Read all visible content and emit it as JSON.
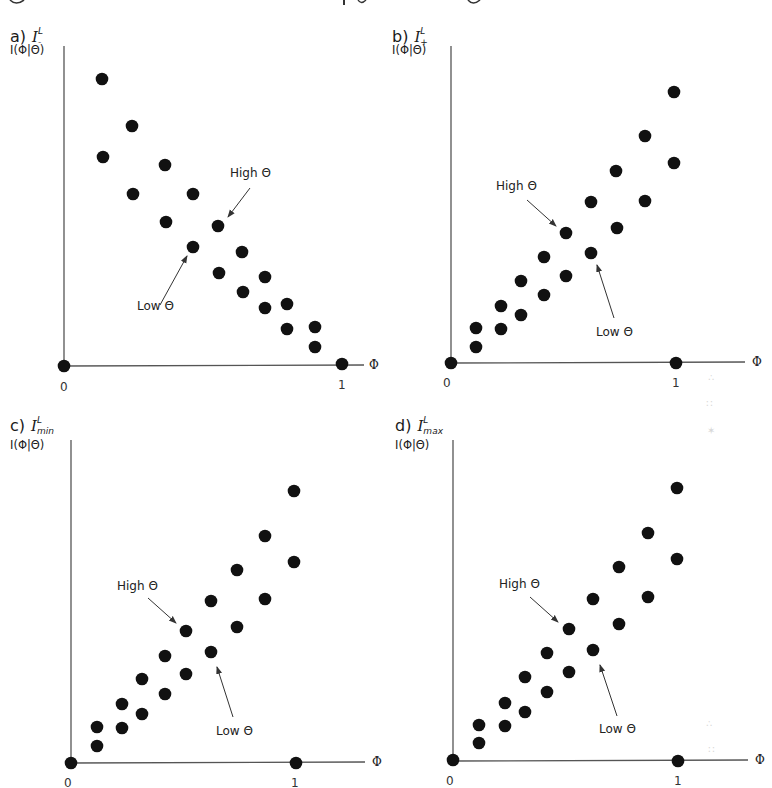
{
  "figure": {
    "caption_cropped": "g                                         , y    g",
    "axis_color": "#555555",
    "dot_color": "#111111",
    "arrow_color": "#333333",
    "dot_radius": 6.3
  },
  "panels": [
    {
      "id": "a",
      "letter": "a)",
      "symbol": "I",
      "superscript": "L",
      "subscript": "-",
      "ylabel": "I(Φ|Θ)",
      "xlabel": "Φ",
      "tick0": "0",
      "tick1": "1",
      "layout": {
        "label_pos": [
          10,
          27
        ],
        "ylabel_pos": [
          10,
          43
        ],
        "origin": [
          64,
          366
        ],
        "yaxis_top": 46,
        "xaxis_end": 364,
        "xlabel_pos": [
          369,
          358
        ],
        "tick0_pos": [
          60,
          380
        ],
        "tick1_pos": [
          338,
          378
        ]
      },
      "high_label": "High Θ",
      "low_label": "Low Θ",
      "high_label_pos": [
        230,
        166
      ],
      "low_label_pos": [
        137,
        299
      ],
      "high_arrow": [
        [
          250,
          188
        ],
        [
          228,
          217
        ]
      ],
      "low_arrow": [
        [
          160,
          305
        ],
        [
          187,
          256
        ]
      ],
      "points_px": [
        [
          64,
          366
        ],
        [
          342,
          364
        ],
        [
          102,
          79
        ],
        [
          103,
          157
        ],
        [
          132,
          126
        ],
        [
          133,
          194
        ],
        [
          165,
          165
        ],
        [
          166,
          222
        ],
        [
          193,
          194
        ],
        [
          193,
          247
        ],
        [
          218,
          226
        ],
        [
          219,
          273
        ],
        [
          242,
          252
        ],
        [
          243,
          292
        ],
        [
          265,
          277
        ],
        [
          265,
          308
        ],
        [
          287,
          304
        ],
        [
          287,
          329
        ],
        [
          315,
          327
        ],
        [
          315,
          347
        ]
      ]
    },
    {
      "id": "b",
      "letter": "b)",
      "symbol": "I",
      "superscript": "L",
      "subscript": "+",
      "ylabel": "I(Φ|Θ)",
      "xlabel": "Φ",
      "tick0": "0",
      "tick1": "1",
      "layout": {
        "label_pos": [
          392,
          27
        ],
        "ylabel_pos": [
          392,
          43
        ],
        "origin": [
          451,
          363
        ],
        "yaxis_top": 46,
        "xaxis_end": 745,
        "xlabel_pos": [
          752,
          355
        ],
        "tick0_pos": [
          443,
          376
        ],
        "tick1_pos": [
          672,
          376
        ]
      },
      "high_label": "High Θ",
      "low_label": "Low Θ",
      "high_label_pos": [
        496,
        179
      ],
      "low_label_pos": [
        596,
        325
      ],
      "high_arrow": [
        [
          527,
          200
        ],
        [
          556,
          226
        ]
      ],
      "low_arrow": [
        [
          614,
          318
        ],
        [
          597,
          265
        ]
      ],
      "points_px": [
        [
          451,
          363
        ],
        [
          676,
          363
        ],
        [
          476,
          328
        ],
        [
          476,
          347
        ],
        [
          501,
          306
        ],
        [
          501,
          329
        ],
        [
          521,
          281
        ],
        [
          521,
          315
        ],
        [
          544,
          257
        ],
        [
          544,
          295
        ],
        [
          566,
          233
        ],
        [
          566,
          276
        ],
        [
          591,
          202
        ],
        [
          591,
          253
        ],
        [
          616,
          171
        ],
        [
          617,
          228
        ],
        [
          645,
          136
        ],
        [
          645,
          201
        ],
        [
          674,
          92
        ],
        [
          674,
          163
        ]
      ]
    },
    {
      "id": "c",
      "letter": "c)",
      "symbol": "I",
      "superscript": "L",
      "subscript": "min",
      "ylabel": "I(Φ|Θ)",
      "xlabel": "Φ",
      "tick0": "0",
      "tick1": "1",
      "layout": {
        "label_pos": [
          10,
          416
        ],
        "ylabel_pos": [
          10,
          438
        ],
        "origin": [
          71,
          763
        ],
        "yaxis_top": 440,
        "xaxis_end": 365,
        "xlabel_pos": [
          372,
          755
        ],
        "tick0_pos": [
          64,
          776
        ],
        "tick1_pos": [
          291,
          776
        ]
      },
      "high_label": "High Θ",
      "low_label": "Low Θ",
      "high_label_pos": [
        117,
        579
      ],
      "low_label_pos": [
        216,
        724
      ],
      "high_arrow": [
        [
          148,
          598
        ],
        [
          176,
          623
        ]
      ],
      "low_arrow": [
        [
          233,
          717
        ],
        [
          217,
          667
        ]
      ],
      "points_px": [
        [
          71,
          763
        ],
        [
          296,
          763
        ],
        [
          97,
          727
        ],
        [
          97,
          746
        ],
        [
          122,
          704
        ],
        [
          122,
          728
        ],
        [
          142,
          679
        ],
        [
          142,
          714
        ],
        [
          165,
          656
        ],
        [
          165,
          694
        ],
        [
          186,
          631
        ],
        [
          186,
          674
        ],
        [
          211,
          601
        ],
        [
          211,
          652
        ],
        [
          237,
          570
        ],
        [
          237,
          627
        ],
        [
          265,
          536
        ],
        [
          265,
          599
        ],
        [
          294,
          491
        ],
        [
          294,
          562
        ]
      ]
    },
    {
      "id": "d",
      "letter": "d)",
      "symbol": "I",
      "superscript": "L",
      "subscript": "max",
      "ylabel": "I(Φ|Θ)",
      "xlabel": "Φ",
      "tick0": "0",
      "tick1": "1",
      "layout": {
        "label_pos": [
          395,
          416
        ],
        "ylabel_pos": [
          395,
          438
        ],
        "origin": [
          453,
          761
        ],
        "yaxis_top": 440,
        "xaxis_end": 748,
        "xlabel_pos": [
          755,
          753
        ],
        "tick0_pos": [
          446,
          774
        ],
        "tick1_pos": [
          674,
          774
        ]
      },
      "high_label": "High Θ",
      "low_label": "Low Θ",
      "high_label_pos": [
        499,
        577
      ],
      "low_label_pos": [
        599,
        722
      ],
      "high_arrow": [
        [
          530,
          597
        ],
        [
          558,
          622
        ]
      ],
      "low_arrow": [
        [
          617,
          716
        ],
        [
          600,
          665
        ]
      ],
      "points_px": [
        [
          453,
          760
        ],
        [
          678,
          761
        ],
        [
          479,
          725
        ],
        [
          479,
          743
        ],
        [
          505,
          703
        ],
        [
          505,
          726
        ],
        [
          525,
          677
        ],
        [
          525,
          712
        ],
        [
          547,
          653
        ],
        [
          547,
          692
        ],
        [
          569,
          629
        ],
        [
          569,
          672
        ],
        [
          593,
          599
        ],
        [
          593,
          650
        ],
        [
          619,
          567
        ],
        [
          619,
          624
        ],
        [
          648,
          533
        ],
        [
          648,
          597
        ],
        [
          677,
          488
        ],
        [
          677,
          559
        ]
      ]
    }
  ],
  "chart_data": [
    {
      "type": "scatter",
      "title": "a) I^L_-",
      "xlabel": "Φ",
      "ylabel": "I(Φ|Θ)",
      "xlim": [
        0,
        1.1
      ],
      "x_ticks": [
        "0",
        "1"
      ],
      "grid": false,
      "annotations": [
        "High Θ",
        "Low Θ"
      ],
      "series": [
        {
          "name": "High Θ",
          "x": [
            0.14,
            0.25,
            0.36,
            0.46,
            0.55,
            0.64,
            0.72,
            0.8,
            0.9
          ],
          "y": [
            0.96,
            0.79,
            0.67,
            0.57,
            0.46,
            0.37,
            0.28,
            0.2,
            0.12
          ]
        },
        {
          "name": "Low Θ",
          "x": [
            0.14,
            0.25,
            0.37,
            0.46,
            0.56,
            0.64,
            0.72,
            0.8,
            0.9
          ],
          "y": [
            0.68,
            0.57,
            0.47,
            0.38,
            0.29,
            0.23,
            0.19,
            0.12,
            0.06
          ]
        },
        {
          "name": "endpoints",
          "x": [
            0,
            1
          ],
          "y": [
            0,
            0
          ]
        }
      ]
    },
    {
      "type": "scatter",
      "title": "b) I^L_+",
      "xlabel": "Φ",
      "ylabel": "I(Φ|Θ)",
      "xlim": [
        0,
        1.3
      ],
      "x_ticks": [
        "0",
        "1"
      ],
      "grid": false,
      "annotations": [
        "High Θ",
        "Low Θ"
      ],
      "series": [
        {
          "name": "High Θ",
          "x": [
            0.11,
            0.22,
            0.31,
            0.41,
            0.51,
            0.62,
            0.73,
            0.86,
            0.99
          ],
          "y": [
            0.11,
            0.19,
            0.27,
            0.36,
            0.44,
            0.55,
            0.66,
            0.79,
            0.94
          ]
        },
        {
          "name": "Low Θ",
          "x": [
            0.11,
            0.22,
            0.31,
            0.41,
            0.51,
            0.62,
            0.74,
            0.86,
            0.99
          ],
          "y": [
            0.05,
            0.11,
            0.16,
            0.22,
            0.29,
            0.36,
            0.45,
            0.56,
            0.69
          ]
        },
        {
          "name": "endpoints",
          "x": [
            0,
            1
          ],
          "y": [
            0,
            0
          ]
        }
      ]
    },
    {
      "type": "scatter",
      "title": "c) I^L_min",
      "xlabel": "Φ",
      "ylabel": "I(Φ|Θ)",
      "xlim": [
        0,
        1.3
      ],
      "x_ticks": [
        "0",
        "1"
      ],
      "grid": false,
      "annotations": [
        "High Θ",
        "Low Θ"
      ],
      "series": [
        {
          "name": "High Θ",
          "x": [
            0.12,
            0.23,
            0.32,
            0.42,
            0.51,
            0.62,
            0.74,
            0.86,
            0.99
          ],
          "y": [
            0.11,
            0.18,
            0.26,
            0.33,
            0.41,
            0.5,
            0.6,
            0.71,
            0.85
          ]
        },
        {
          "name": "Low Θ",
          "x": [
            0.12,
            0.23,
            0.32,
            0.42,
            0.51,
            0.62,
            0.74,
            0.86,
            0.99
          ],
          "y": [
            0.05,
            0.11,
            0.15,
            0.21,
            0.28,
            0.35,
            0.42,
            0.51,
            0.63
          ]
        },
        {
          "name": "endpoints",
          "x": [
            0,
            1
          ],
          "y": [
            0,
            0
          ]
        }
      ]
    },
    {
      "type": "scatter",
      "title": "d) I^L_max",
      "xlabel": "Φ",
      "ylabel": "I(Φ|Θ)",
      "xlim": [
        0,
        1.3
      ],
      "x_ticks": [
        "0",
        "1"
      ],
      "grid": false,
      "annotations": [
        "High Θ",
        "Low Θ"
      ],
      "series": [
        {
          "name": "High Θ",
          "x": [
            0.12,
            0.23,
            0.32,
            0.42,
            0.51,
            0.62,
            0.74,
            0.87,
            0.99
          ],
          "y": [
            0.11,
            0.18,
            0.26,
            0.33,
            0.41,
            0.5,
            0.6,
            0.71,
            0.85
          ]
        },
        {
          "name": "Low Θ",
          "x": [
            0.12,
            0.23,
            0.32,
            0.42,
            0.51,
            0.62,
            0.74,
            0.87,
            0.99
          ],
          "y": [
            0.05,
            0.11,
            0.15,
            0.21,
            0.28,
            0.34,
            0.43,
            0.52,
            0.63
          ]
        },
        {
          "name": "endpoints",
          "x": [
            0,
            1
          ],
          "y": [
            0,
            0
          ]
        }
      ]
    }
  ]
}
